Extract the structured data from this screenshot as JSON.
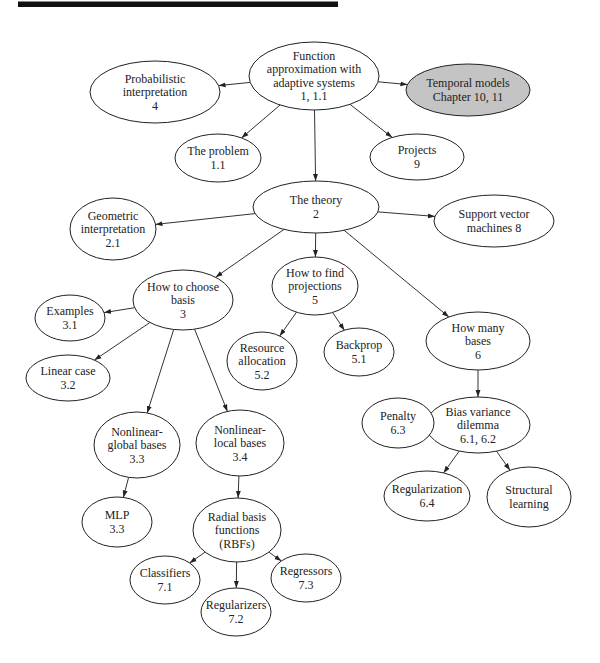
{
  "diagram": {
    "type": "concept-map",
    "nodes": [
      {
        "id": "root",
        "lines": [
          "Function",
          "approximation with",
          "adaptive systems",
          "1, 1.1"
        ],
        "cx": 314,
        "cy": 76,
        "rx": 65,
        "ry": 34,
        "shaded": false
      },
      {
        "id": "prob",
        "lines": [
          "Probabilistic",
          "interpretation",
          "4"
        ],
        "cx": 155,
        "cy": 92,
        "rx": 65,
        "ry": 31,
        "shaded": false
      },
      {
        "id": "temporal",
        "lines": [
          "Temporal models",
          "Chapter 10, 11"
        ],
        "cx": 468,
        "cy": 90,
        "rx": 62,
        "ry": 26,
        "shaded": true
      },
      {
        "id": "problem",
        "lines": [
          "The problem",
          "1.1"
        ],
        "cx": 218,
        "cy": 158,
        "rx": 43,
        "ry": 24,
        "shaded": false
      },
      {
        "id": "projects",
        "lines": [
          "Projects",
          "9"
        ],
        "cx": 417,
        "cy": 157,
        "rx": 47,
        "ry": 23,
        "shaded": false
      },
      {
        "id": "theory",
        "lines": [
          "The theory",
          "2"
        ],
        "cx": 316,
        "cy": 207,
        "rx": 63,
        "ry": 26,
        "shaded": false
      },
      {
        "id": "geometric",
        "lines": [
          "Geometric",
          "interpretation",
          "2.1"
        ],
        "cx": 113,
        "cy": 229,
        "rx": 43,
        "ry": 31,
        "shaded": false
      },
      {
        "id": "svm",
        "lines": [
          "Support vector",
          "machines 8"
        ],
        "cx": 494,
        "cy": 221,
        "rx": 60,
        "ry": 26,
        "shaded": false
      },
      {
        "id": "choose",
        "lines": [
          "How to choose",
          "basis",
          "3"
        ],
        "cx": 183,
        "cy": 300,
        "rx": 50,
        "ry": 30,
        "shaded": false
      },
      {
        "id": "find",
        "lines": [
          "How to find",
          "projections",
          "5"
        ],
        "cx": 315,
        "cy": 286,
        "rx": 43,
        "ry": 29,
        "shaded": false
      },
      {
        "id": "howmany",
        "lines": [
          "How many",
          "bases",
          "6"
        ],
        "cx": 478,
        "cy": 341,
        "rx": 52,
        "ry": 29,
        "shaded": false
      },
      {
        "id": "examples",
        "lines": [
          "Examples",
          "3.1"
        ],
        "cx": 70,
        "cy": 318,
        "rx": 35,
        "ry": 23,
        "shaded": false
      },
      {
        "id": "linear",
        "lines": [
          "Linear case",
          "3.2"
        ],
        "cx": 68,
        "cy": 378,
        "rx": 42,
        "ry": 23,
        "shaded": false
      },
      {
        "id": "resource",
        "lines": [
          "Resource",
          "allocation",
          "5.2"
        ],
        "cx": 262,
        "cy": 361,
        "rx": 35,
        "ry": 29,
        "shaded": false
      },
      {
        "id": "backprop",
        "lines": [
          "Backprop",
          "5.1"
        ],
        "cx": 359,
        "cy": 352,
        "rx": 35,
        "ry": 24,
        "shaded": false
      },
      {
        "id": "nlglobal",
        "lines": [
          "Nonlinear-",
          "global bases",
          "3.3"
        ],
        "cx": 137,
        "cy": 445,
        "rx": 43,
        "ry": 33,
        "shaded": false
      },
      {
        "id": "nllocal",
        "lines": [
          "Nonlinear-",
          "local bases",
          "3.4"
        ],
        "cx": 240,
        "cy": 443,
        "rx": 44,
        "ry": 33,
        "shaded": false
      },
      {
        "id": "bias",
        "lines": [
          "Bias variance",
          "dilemma",
          "6.1, 6.2"
        ],
        "cx": 478,
        "cy": 425,
        "rx": 52,
        "ry": 28,
        "shaded": false
      },
      {
        "id": "penalty",
        "lines": [
          "Penalty",
          "6.3"
        ],
        "cx": 398,
        "cy": 423,
        "rx": 36,
        "ry": 25,
        "shaded": false
      },
      {
        "id": "regularization",
        "lines": [
          "Regularization",
          "6.4"
        ],
        "cx": 427,
        "cy": 496,
        "rx": 43,
        "ry": 25,
        "shaded": false
      },
      {
        "id": "structural",
        "lines": [
          "Structural",
          "learning"
        ],
        "cx": 529,
        "cy": 497,
        "rx": 42,
        "ry": 30,
        "shaded": false
      },
      {
        "id": "mlp",
        "lines": [
          "MLP",
          "3.3"
        ],
        "cx": 117,
        "cy": 522,
        "rx": 35,
        "ry": 25,
        "shaded": false
      },
      {
        "id": "rbf",
        "lines": [
          "Radial basis",
          "functions",
          "(RBFs)"
        ],
        "cx": 237,
        "cy": 530,
        "rx": 44,
        "ry": 32,
        "shaded": false
      },
      {
        "id": "classifiers",
        "lines": [
          "Classifiers",
          "7.1"
        ],
        "cx": 165,
        "cy": 580,
        "rx": 35,
        "ry": 24,
        "shaded": false
      },
      {
        "id": "regularizers",
        "lines": [
          "Regularizers",
          "7.2"
        ],
        "cx": 236,
        "cy": 612,
        "rx": 35,
        "ry": 24,
        "shaded": false
      },
      {
        "id": "regressors",
        "lines": [
          "Regressors",
          "7.3"
        ],
        "cx": 306,
        "cy": 578,
        "rx": 35,
        "ry": 24,
        "shaded": false
      }
    ],
    "edges": [
      {
        "from": "root",
        "to": "prob"
      },
      {
        "from": "root",
        "to": "temporal"
      },
      {
        "from": "root",
        "to": "problem"
      },
      {
        "from": "root",
        "to": "projects"
      },
      {
        "from": "root",
        "to": "theory"
      },
      {
        "from": "theory",
        "to": "geometric"
      },
      {
        "from": "theory",
        "to": "svm"
      },
      {
        "from": "theory",
        "to": "choose"
      },
      {
        "from": "theory",
        "to": "find"
      },
      {
        "from": "theory",
        "to": "howmany"
      },
      {
        "from": "choose",
        "to": "examples"
      },
      {
        "from": "choose",
        "to": "linear"
      },
      {
        "from": "choose",
        "to": "nlglobal"
      },
      {
        "from": "choose",
        "to": "nllocal"
      },
      {
        "from": "find",
        "to": "resource"
      },
      {
        "from": "find",
        "to": "backprop"
      },
      {
        "from": "howmany",
        "to": "bias"
      },
      {
        "from": "bias",
        "to": "penalty"
      },
      {
        "from": "bias",
        "to": "regularization"
      },
      {
        "from": "bias",
        "to": "structural"
      },
      {
        "from": "nlglobal",
        "to": "mlp"
      },
      {
        "from": "nllocal",
        "to": "rbf"
      },
      {
        "from": "rbf",
        "to": "classifiers"
      },
      {
        "from": "rbf",
        "to": "regularizers"
      },
      {
        "from": "rbf",
        "to": "regressors"
      }
    ],
    "colors": {
      "shaded_fill": "#c4c4c4",
      "stroke": "#222222",
      "top_rule": "#111111"
    }
  }
}
